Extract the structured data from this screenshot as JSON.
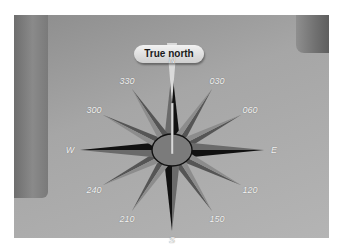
{
  "diagram": {
    "callout": {
      "label": "True north"
    },
    "labels": [
      {
        "text": "N",
        "angle": 0
      },
      {
        "text": "030",
        "angle": 30
      },
      {
        "text": "060",
        "angle": 60
      },
      {
        "text": "E",
        "angle": 90
      },
      {
        "text": "120",
        "angle": 120
      },
      {
        "text": "150",
        "angle": 150
      },
      {
        "text": "S",
        "angle": 180
      },
      {
        "text": "210",
        "angle": 210
      },
      {
        "text": "240",
        "angle": 240
      },
      {
        "text": "W",
        "angle": 270
      },
      {
        "text": "300",
        "angle": 300
      },
      {
        "text": "330",
        "angle": 330
      }
    ],
    "colors": {
      "background": "#a6a6a6",
      "cardinal_dark": "#111111",
      "cardinal_light": "#6a6a6a",
      "intercardinal_dark": "#555555",
      "intercardinal_light": "#8c8c8c",
      "hub_fill": "#7b7b7b",
      "needle": "#d8d8d8",
      "label_text": "#f4f4f4"
    }
  }
}
